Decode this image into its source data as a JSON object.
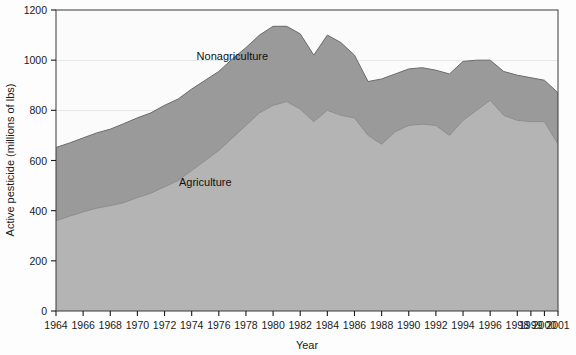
{
  "chart_data": {
    "type": "area",
    "stacked": true,
    "title": "",
    "xlabel": "Year",
    "ylabel": "Active pesticide (millions of lbs)",
    "xlim": [
      1964,
      2001
    ],
    "ylim": [
      0,
      1200
    ],
    "y_ticks": [
      0,
      200,
      400,
      600,
      800,
      1000,
      1200
    ],
    "x_tick_labels": [
      "1964",
      "1966",
      "1968",
      "1970",
      "1972",
      "1974",
      "1976",
      "1978",
      "1980",
      "1982",
      "1984",
      "1986",
      "1988",
      "1990",
      "1992",
      "1994",
      "1996",
      "1998",
      "1999",
      "2000",
      "2001"
    ],
    "grid": "horizontal-light",
    "legend_position": "inline-labels",
    "x": [
      1964,
      1965,
      1966,
      1967,
      1968,
      1969,
      1970,
      1971,
      1972,
      1973,
      1974,
      1975,
      1976,
      1977,
      1978,
      1979,
      1980,
      1981,
      1982,
      1983,
      1984,
      1985,
      1986,
      1987,
      1988,
      1989,
      1990,
      1991,
      1992,
      1993,
      1994,
      1995,
      1996,
      1997,
      1998,
      1999,
      2000,
      2001
    ],
    "series": [
      {
        "name": "Agriculture",
        "color": "#b4b4b4",
        "values": [
          360,
          378,
          395,
          410,
          420,
          432,
          452,
          470,
          495,
          520,
          560,
          600,
          640,
          690,
          740,
          790,
          820,
          835,
          805,
          755,
          800,
          780,
          770,
          700,
          665,
          715,
          740,
          745,
          740,
          700,
          760,
          800,
          840,
          780,
          760,
          755,
          755,
          665
        ]
      },
      {
        "name": "Nonagriculture",
        "color": "#9a9a9a",
        "values": [
          292,
          292,
          295,
          300,
          305,
          315,
          318,
          320,
          325,
          325,
          325,
          320,
          315,
          315,
          310,
          310,
          315,
          300,
          300,
          265,
          300,
          290,
          250,
          215,
          260,
          230,
          225,
          225,
          220,
          245,
          235,
          200,
          160,
          175,
          180,
          175,
          165,
          205
        ]
      }
    ],
    "totals": [
      652,
      670,
      690,
      710,
      725,
      747,
      770,
      790,
      820,
      845,
      885,
      920,
      955,
      1005,
      1050,
      1100,
      1135,
      1135,
      1105,
      1020,
      1100,
      1070,
      1020,
      915,
      925,
      945,
      965,
      970,
      960,
      945,
      995,
      1000,
      1000,
      955,
      940,
      930,
      920,
      870
    ],
    "annotations": [
      {
        "text": "Nonagriculture",
        "x": 1977,
        "y": 1000
      },
      {
        "text": "Agriculture",
        "x": 1975,
        "y": 500
      }
    ]
  },
  "axis": {
    "y_title": "Active pesticide (millions of lbs)",
    "x_title": "Year"
  },
  "colors": {
    "agriculture": "#b4b4b4",
    "nonagriculture": "#9a9a9a",
    "plot_border": "#6e6e6e",
    "axis_text": "#1a1a1a",
    "gridline": "#e4e4e4"
  }
}
